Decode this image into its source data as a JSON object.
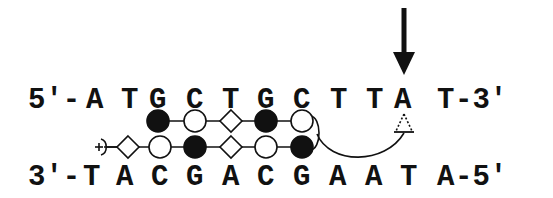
{
  "diagram": {
    "top_strand": {
      "prefix": "5'-",
      "bases": [
        "A",
        "T",
        "G",
        "C",
        "T",
        "G",
        "C",
        "T",
        "T",
        "A"
      ],
      "suffix_base": "T",
      "suffix": "-3'",
      "x_positions": [
        95,
        130,
        165,
        200,
        235,
        271,
        306,
        341,
        376,
        411
      ]
    },
    "bottom_strand": {
      "prefix": "3'-",
      "bases": [
        "T",
        "A",
        "C",
        "G",
        "A",
        "C",
        "G",
        "A",
        "A",
        "T"
      ],
      "suffix_base": "A",
      "suffix": "-5'",
      "x_positions": [
        95,
        130,
        165,
        200,
        235,
        271,
        306,
        341,
        376,
        411
      ]
    },
    "arrow": {
      "label": "cleavage-site-arrow",
      "target_base": "A",
      "target_index": 9
    },
    "hairpin_polyamide": {
      "top_row": [
        {
          "type": "filled-circle",
          "x": 158
        },
        {
          "type": "open-circle",
          "x": 195
        },
        {
          "type": "open-diamond",
          "x": 231
        },
        {
          "type": "filled-circle",
          "x": 266
        },
        {
          "type": "open-circle",
          "x": 302
        }
      ],
      "bottom_row": [
        {
          "type": "plus-tail",
          "x": 101
        },
        {
          "type": "open-diamond",
          "x": 128
        },
        {
          "type": "open-circle",
          "x": 160
        },
        {
          "type": "filled-circle",
          "x": 195
        },
        {
          "type": "open-diamond",
          "x": 231
        },
        {
          "type": "open-circle",
          "x": 266
        },
        {
          "type": "filled-circle",
          "x": 302
        }
      ],
      "end_symbol": "+",
      "linker_target": "dashed-triangle"
    },
    "colors": {
      "ink": "#111111",
      "background": "#ffffff"
    }
  }
}
